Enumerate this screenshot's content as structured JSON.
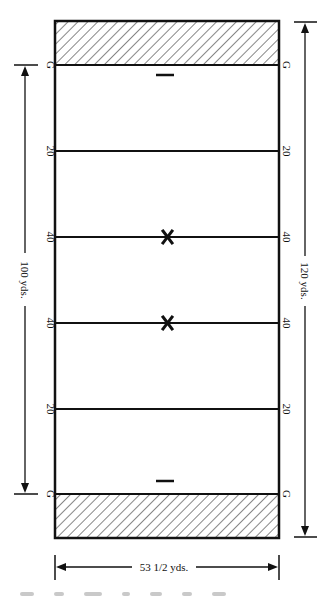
{
  "diagram": {
    "colors": {
      "line": "#111111",
      "background": "#ffffff",
      "hatch": "#222222"
    },
    "goal_label": "G",
    "yard_lines": [
      {
        "label": "G",
        "y": 65,
        "type": "goal"
      },
      {
        "label": "20",
        "y": 151,
        "type": "yard"
      },
      {
        "label": "40",
        "y": 237,
        "type": "yard",
        "marker": "X"
      },
      {
        "label": "40",
        "y": 323,
        "type": "yard",
        "marker": "X"
      },
      {
        "label": "20",
        "y": 409,
        "type": "yard"
      },
      {
        "label": "G",
        "y": 494,
        "type": "goal"
      }
    ],
    "markers": {
      "x_symbol": "X",
      "dash_symbol": "—"
    },
    "dimensions": {
      "length_between_goals": "100 yds.",
      "total_length": "120 yds.",
      "width": "53 1/2 yds."
    },
    "end_zones": {
      "top": "hatched",
      "bottom": "hatched"
    }
  }
}
